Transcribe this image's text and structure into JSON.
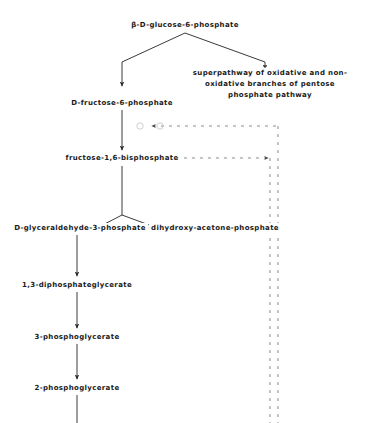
{
  "diagram": {
    "background_color": "#ffffff",
    "line_color": "#3a3a3a",
    "text_color": "#1a1a1a",
    "nodes": [
      {
        "id": "g6p",
        "label": "β-D-glucose-6-phosphate",
        "x": 185,
        "y": 25,
        "width": 120
      },
      {
        "id": "ppp",
        "label": "superpathway of oxidative and non-oxidative branches of pentose phosphate pathway",
        "x": 270,
        "y": 84,
        "width": 172
      },
      {
        "id": "f6p",
        "label": "D-fructose-6-phosphate",
        "x": 122,
        "y": 103,
        "width": 110
      },
      {
        "id": "fbp",
        "label": "fructose-1,6-bisphosphate",
        "x": 122,
        "y": 158,
        "width": 114
      },
      {
        "id": "g3p",
        "label": "D-glyceraldehyde-3-phosphate",
        "x": 80,
        "y": 228,
        "width": 132
      },
      {
        "id": "dhap",
        "label": "dihydroxy-acetone-phosphate",
        "x": 215,
        "y": 228,
        "width": 128
      },
      {
        "id": "bpg",
        "label": "1,3-diphosphateglycerate",
        "x": 77,
        "y": 285,
        "width": 116
      },
      {
        "id": "pg3",
        "label": "3-phosphoglycerate",
        "x": 77,
        "y": 337,
        "width": 92
      },
      {
        "id": "pg2",
        "label": "2-phosphoglycerate",
        "x": 77,
        "y": 388,
        "width": 92
      }
    ],
    "edges": [
      {
        "id": "g6p-to-f6p-fork",
        "kind": "solid-fork-left",
        "arrow": true
      },
      {
        "id": "g6p-to-ppp-fork",
        "kind": "solid-fork-right",
        "arrow": true
      },
      {
        "id": "f6p-to-fbp",
        "kind": "solid-vertical",
        "arrow": true
      },
      {
        "id": "fbp-fork-to-g3p",
        "kind": "solid-fork-left",
        "arrow": true
      },
      {
        "id": "fbp-fork-to-dhap",
        "kind": "solid-fork-right",
        "arrow": true
      },
      {
        "id": "dhap-to-g3p",
        "kind": "solid-horizontal-left",
        "arrow": true
      },
      {
        "id": "g3p-to-bpg",
        "kind": "solid-vertical",
        "arrow": true
      },
      {
        "id": "bpg-to-pg3",
        "kind": "solid-vertical",
        "arrow": true
      },
      {
        "id": "pg3-to-pg2",
        "kind": "solid-vertical",
        "arrow": true
      },
      {
        "id": "pg2-downstream",
        "kind": "solid-vertical-open",
        "arrow": false
      },
      {
        "id": "right-return-to-f6p",
        "kind": "dashed-horizontal-left",
        "arrow": true
      },
      {
        "id": "fbp-to-right-dashed",
        "kind": "dashed-horizontal-right",
        "arrow": true
      },
      {
        "id": "right-rail-outer",
        "kind": "dashed-vertical",
        "arrow": false
      },
      {
        "id": "right-rail-inner",
        "kind": "dashed-vertical",
        "arrow": false
      }
    ],
    "markers": [
      {
        "id": "reaction-node-1",
        "x": 140,
        "y": 126,
        "r": 3.2
      },
      {
        "id": "reaction-node-2",
        "x": 160,
        "y": 126,
        "r": 3.2
      }
    ]
  }
}
